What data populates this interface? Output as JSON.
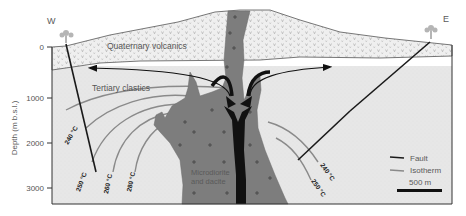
{
  "compass": {
    "west": "W",
    "east": "E"
  },
  "axis": {
    "ylabel": "Depth (m b.s.l.)",
    "ticks": [
      {
        "label": "0",
        "y": 47
      },
      {
        "label": "1000",
        "y": 98
      },
      {
        "label": "2000",
        "y": 143
      },
      {
        "label": "3000",
        "y": 188
      }
    ]
  },
  "units": {
    "quaternary": "Quaternary volcanics",
    "tertiary": "Tertiary clastics",
    "intrusion_line1": "Microdiorite",
    "intrusion_line2": "and dacite"
  },
  "isotherms_west": [
    "240 °C",
    "250 °C",
    "260 °C",
    "280 °C"
  ],
  "isotherms_east": [
    "240 °C",
    "250 °C"
  ],
  "legend": {
    "fault": "Fault",
    "isotherm": "Isotherm",
    "scale": "500 m"
  },
  "colors": {
    "volcanics_bg": "#eeeeee",
    "clastics_bg": "#e9e9e9",
    "intrusion": "#7d7d7d",
    "conduit": "#111111",
    "fault": "#1a1a1a",
    "isotherm": "#8a8a8a",
    "frame": "#333333"
  }
}
